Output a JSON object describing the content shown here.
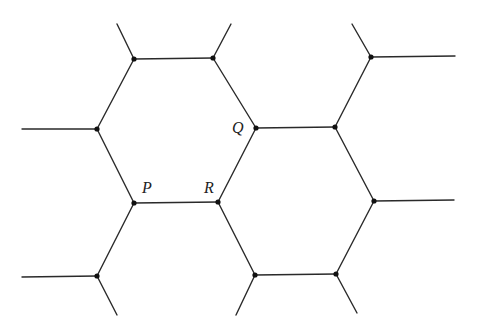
{
  "diagram": {
    "type": "hexagonal-lattice",
    "colors": {
      "line": "#2a2a2a",
      "vertex": "#111111",
      "background": "#ffffff"
    },
    "labels": [
      {
        "id": "P",
        "text": "P",
        "x": 142,
        "y": 180
      },
      {
        "id": "Q",
        "text": "Q",
        "x": 232,
        "y": 120
      },
      {
        "id": "R",
        "text": "R",
        "x": 204,
        "y": 180
      }
    ],
    "vertices": [
      {
        "id": "A",
        "x": 134,
        "y": 59
      },
      {
        "id": "B",
        "x": 213,
        "y": 58
      },
      {
        "id": "C",
        "x": 97,
        "y": 129
      },
      {
        "id": "Q",
        "x": 256,
        "y": 128
      },
      {
        "id": "D",
        "x": 335,
        "y": 127
      },
      {
        "id": "E",
        "x": 371,
        "y": 57
      },
      {
        "id": "P",
        "x": 134,
        "y": 203
      },
      {
        "id": "R",
        "x": 218,
        "y": 202
      },
      {
        "id": "F",
        "x": 374,
        "y": 201
      },
      {
        "id": "G",
        "x": 97,
        "y": 276
      },
      {
        "id": "H",
        "x": 255,
        "y": 275
      },
      {
        "id": "I",
        "x": 336,
        "y": 274
      }
    ],
    "edges": [
      [
        117,
        24,
        134,
        59
      ],
      [
        231,
        24,
        213,
        58
      ],
      [
        134,
        59,
        213,
        58
      ],
      [
        134,
        59,
        97,
        129
      ],
      [
        213,
        58,
        256,
        128
      ],
      [
        22,
        129,
        97,
        129
      ],
      [
        97,
        129,
        134,
        203
      ],
      [
        256,
        128,
        335,
        127
      ],
      [
        256,
        128,
        218,
        202
      ],
      [
        335,
        127,
        371,
        57
      ],
      [
        352,
        24,
        371,
        57
      ],
      [
        371,
        57,
        455,
        56
      ],
      [
        335,
        127,
        374,
        201
      ],
      [
        134,
        203,
        218,
        202
      ],
      [
        134,
        203,
        97,
        276
      ],
      [
        218,
        202,
        255,
        275
      ],
      [
        374,
        201,
        454,
        200
      ],
      [
        374,
        201,
        336,
        274
      ],
      [
        22,
        277,
        97,
        276
      ],
      [
        97,
        276,
        117,
        315
      ],
      [
        255,
        275,
        336,
        274
      ],
      [
        255,
        275,
        236,
        315
      ],
      [
        336,
        274,
        357,
        313
      ]
    ]
  }
}
